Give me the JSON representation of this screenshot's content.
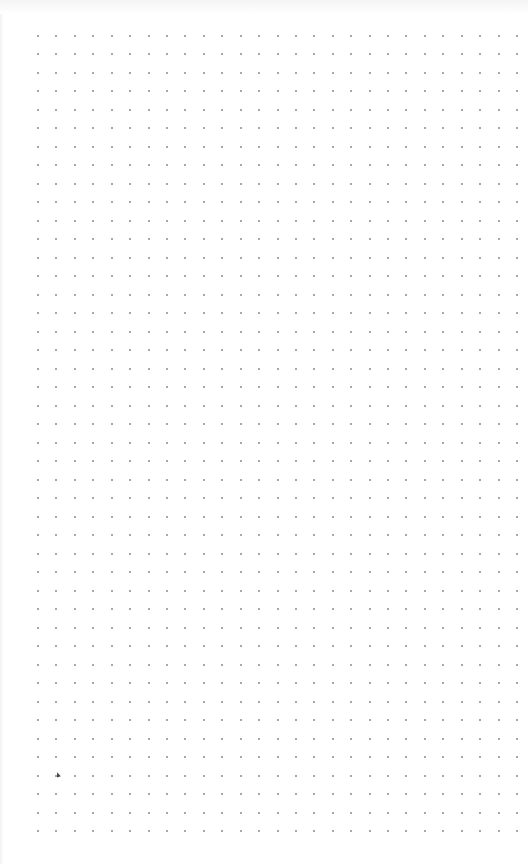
{
  "canvas": {
    "type": "dot-grid",
    "columns": 27,
    "rows": 44,
    "dot_color": "#8a8a8a",
    "background_color": "#ffffff"
  }
}
